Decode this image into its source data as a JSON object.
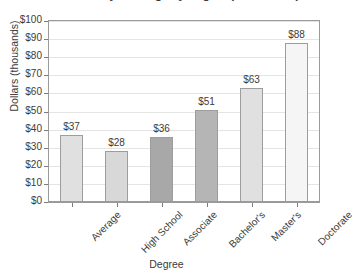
{
  "chart_data": {
    "type": "bar",
    "title": "Median Weekly Earnings by Degree (Annualized)",
    "xlabel": "Degree",
    "ylabel": "Dollars (thousands)",
    "categories": [
      "Average",
      "High School",
      "Associate",
      "Bachelor's",
      "Master's",
      "Doctorate"
    ],
    "values": [
      37,
      28,
      36,
      51,
      63,
      88
    ],
    "value_labels": [
      "$37",
      "$28",
      "$36",
      "$51",
      "$63",
      "$88"
    ],
    "bar_colors": [
      "#e0e0e0",
      "#d8d8d8",
      "#a8a8a8",
      "#b5b5b5",
      "#e0e0e0",
      "#f5f5f5"
    ],
    "ylim": [
      0,
      100
    ],
    "ytick_values": [
      0,
      10,
      20,
      30,
      40,
      50,
      60,
      70,
      80,
      90,
      100
    ],
    "ytick_labels": [
      "$0",
      "$10",
      "$20",
      "$30",
      "$40",
      "$50",
      "$60",
      "$70",
      "$80",
      "$90",
      "$100"
    ],
    "grid": true,
    "legend": "none",
    "bar_border_color": "#9d9d9d",
    "axis_color": "#9a9a9a",
    "gridline_color": "#e4e4e4",
    "text_color": "#3b3b3b"
  }
}
